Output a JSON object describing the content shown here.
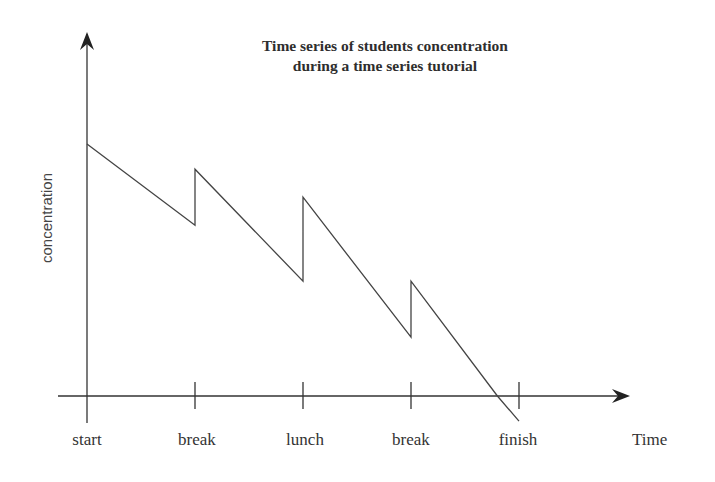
{
  "chart_data": {
    "type": "line",
    "title": "Time series of students concentration during a time series tutorial",
    "title_lines": [
      "Time series of students concentration",
      "during a time series tutorial"
    ],
    "xlabel": "Time",
    "ylabel": "concentration",
    "categories": [
      "start",
      "break",
      "lunch",
      "break",
      "finish"
    ],
    "y_ticks_shown": false,
    "grid": false,
    "legend": "none",
    "ylim": [
      0,
      100
    ],
    "note": "Sawtooth pattern: concentration decays linearly between events and jumps up instantly at each break/lunch. Values on an arbitrary 0-100 scale (no y ticks shown).",
    "series": [
      {
        "name": "concentration",
        "points": [
          {
            "x": 0,
            "label": "start",
            "y": 90
          },
          {
            "x": 1,
            "label": "break",
            "y": 61
          },
          {
            "x": 1,
            "label": "break",
            "y": 81
          },
          {
            "x": 2,
            "label": "lunch",
            "y": 41
          },
          {
            "x": 2,
            "label": "lunch",
            "y": 71
          },
          {
            "x": 3,
            "label": "break",
            "y": 21
          },
          {
            "x": 3,
            "label": "break",
            "y": 41
          },
          {
            "x": 3.8,
            "label": "",
            "y": 0
          },
          {
            "x": 4,
            "label": "finish",
            "y": -9
          }
        ]
      }
    ]
  },
  "labels": {
    "title_line1": "Time series of students concentration",
    "title_line2": "during a time series tutorial",
    "ylabel": "concentration",
    "xlabel": "Time",
    "ticks": [
      "start",
      "break",
      "lunch",
      "break",
      "finish"
    ]
  },
  "colors": {
    "axis": "#333333",
    "line": "#444444",
    "text": "#333333"
  }
}
